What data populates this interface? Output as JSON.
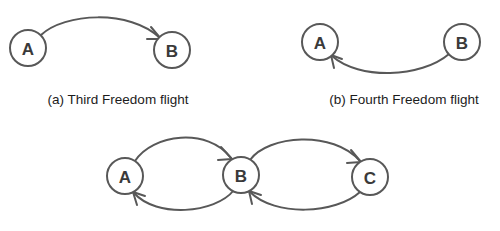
{
  "figure": {
    "background_color": "#ffffff",
    "stroke_color": "#585858",
    "label_color": "#3a3a3a",
    "caption_color": "#1c1c1c"
  },
  "panels": {
    "a": {
      "caption": "(a) Third Freedom flight",
      "caption_x": 118,
      "caption_y": 104,
      "nodes": [
        {
          "id": "A",
          "label": "A",
          "cx": 28,
          "cy": 48,
          "r": 18
        },
        {
          "id": "B",
          "label": "B",
          "cx": 172,
          "cy": 50,
          "r": 18
        }
      ],
      "edges": [
        {
          "id": "a-to-b",
          "from": "A",
          "to": "B",
          "direction": "A to B",
          "path": "M 41 35 C 64 13, 130 9, 160 38",
          "arrow": "M 151 27 L 161 39 L 147 39"
        }
      ]
    },
    "b": {
      "caption": "(b) Fourth Freedom flight",
      "caption_x": 404,
      "caption_y": 104,
      "nodes": [
        {
          "id": "A",
          "label": "A",
          "cx": 320,
          "cy": 42,
          "r": 18
        },
        {
          "id": "B",
          "label": "B",
          "cx": 462,
          "cy": 42,
          "r": 18
        }
      ],
      "edges": [
        {
          "id": "b-to-a",
          "from": "B",
          "to": "A",
          "direction": "B to A",
          "path": "M 449 54 C 421 78, 359 80, 332 56",
          "arrow": "M 342 59 L 331 55 L 334 68"
        }
      ]
    },
    "c": {
      "caption": "",
      "nodes": [
        {
          "id": "A",
          "label": "A",
          "cx": 125,
          "cy": 176,
          "r": 18
        },
        {
          "id": "B",
          "label": "B",
          "cx": 241,
          "cy": 175,
          "r": 18
        },
        {
          "id": "C",
          "label": "C",
          "cx": 370,
          "cy": 177,
          "r": 18
        }
      ],
      "edges": [
        {
          "id": "c-a-to-b",
          "from": "A",
          "to": "B",
          "direction": "A to B",
          "path": "M 135 161 C 152 134, 208 127, 231 158",
          "arrow": "M 221 147 L 232 159 L 218 160"
        },
        {
          "id": "c-b-to-a",
          "from": "B",
          "to": "A",
          "direction": "B to A",
          "path": "M 234 190 C 215 214, 156 218, 134 193",
          "arrow": "M 145 196 L 133 192 L 137 205"
        },
        {
          "id": "c-b-to-c",
          "from": "B",
          "to": "C",
          "direction": "B to C",
          "path": "M 250 160 C 268 135, 333 130, 360 161",
          "arrow": "M 351 150 L 361 162 L 347 163"
        },
        {
          "id": "c-c-to-b",
          "from": "C",
          "to": "B",
          "direction": "C to B",
          "path": "M 360 192 C 336 214, 275 217, 250 192",
          "arrow": "M 261 195 L 249 191 L 252 204"
        }
      ]
    }
  },
  "chart_data": {
    "type": "diagram",
    "subfigures": [
      {
        "key": "a",
        "caption": "(a) Third Freedom flight",
        "nodes": [
          "A",
          "B"
        ],
        "directed_edges": [
          [
            "A",
            "B"
          ]
        ]
      },
      {
        "key": "b",
        "caption": "(b) Fourth Freedom flight",
        "nodes": [
          "A",
          "B"
        ],
        "directed_edges": [
          [
            "B",
            "A"
          ]
        ]
      },
      {
        "key": "c",
        "caption": "",
        "nodes": [
          "A",
          "B",
          "C"
        ],
        "directed_edges": [
          [
            "A",
            "B"
          ],
          [
            "B",
            "A"
          ],
          [
            "B",
            "C"
          ],
          [
            "C",
            "B"
          ]
        ]
      }
    ]
  }
}
